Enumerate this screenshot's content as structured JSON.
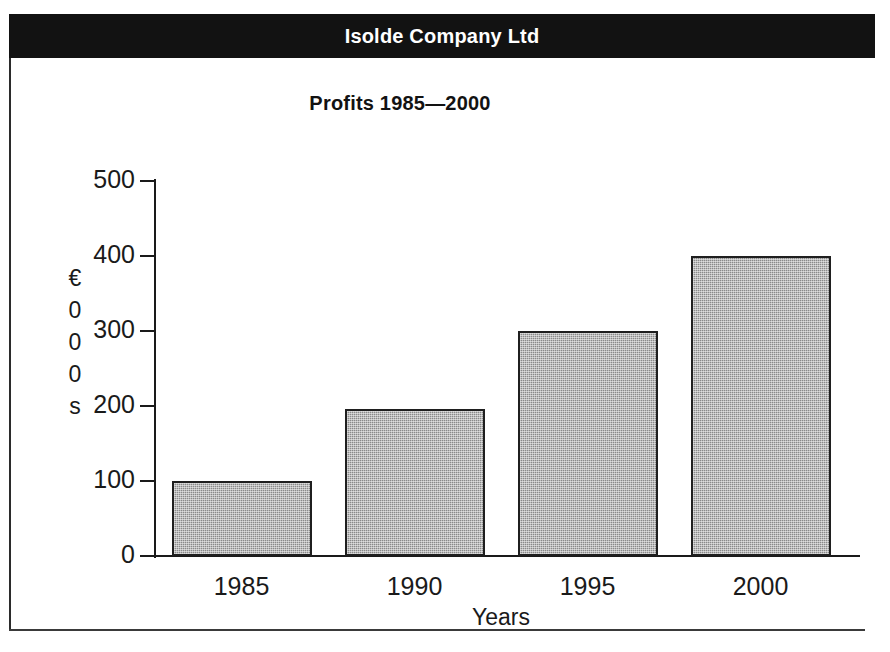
{
  "banner": {
    "company_name": "Isolde Company Ltd",
    "background_color": "#121212",
    "text_color": "#ffffff"
  },
  "chart_data": {
    "type": "bar",
    "title": "Profits 1985—2000",
    "categories": [
      "1985",
      "1990",
      "1995",
      "2000"
    ],
    "values": [
      100,
      196,
      300,
      400
    ],
    "xlabel": "Years",
    "ylabel": "€000s",
    "ylabel_stacked": [
      "€",
      "0",
      "0",
      "0",
      "s"
    ],
    "ylim": [
      0,
      500
    ],
    "ytick_labels": [
      "0",
      "100",
      "200",
      "300",
      "400",
      "500"
    ],
    "ytick_values": [
      0,
      100,
      200,
      300,
      400,
      500
    ],
    "grid": false,
    "legend": "none",
    "bar_fill_color": "#8a8a8a",
    "bar_border_color": "#1f1f1f",
    "background_color": "#ffffff"
  }
}
